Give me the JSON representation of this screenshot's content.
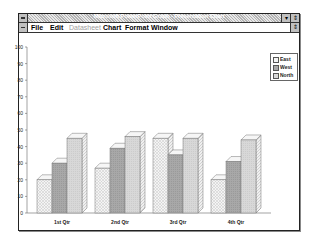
{
  "window": {
    "title": "Microsoft PowerPoint Graph - Presentation Chart",
    "controls": {
      "minimize": "▾",
      "restore": "⇕"
    }
  },
  "menu": {
    "items": [
      {
        "label": "File",
        "enabled": true
      },
      {
        "label": "Edit",
        "enabled": true
      },
      {
        "label": "Datasheet",
        "enabled": false
      },
      {
        "label": "Chart",
        "enabled": true
      },
      {
        "label": "Format",
        "enabled": true
      },
      {
        "label": "Window",
        "enabled": true
      }
    ],
    "restore_glyph": "⇕"
  },
  "legend": {
    "items": [
      {
        "label": "East",
        "color": "#eeeeee"
      },
      {
        "label": "West",
        "color": "#a8a8a8"
      },
      {
        "label": "North",
        "color": "#d6d6d6"
      }
    ]
  },
  "chart_data": {
    "type": "bar",
    "style": "3d-clustered-column",
    "title": "",
    "xlabel": "",
    "ylabel": "",
    "categories": [
      "1st Qtr",
      "2nd Qtr",
      "3rd Qtr",
      "4th Qtr"
    ],
    "series": [
      {
        "name": "East",
        "values": [
          20,
          27,
          45,
          20
        ]
      },
      {
        "name": "West",
        "values": [
          30,
          39,
          35,
          31
        ]
      },
      {
        "name": "North",
        "values": [
          45,
          46,
          45,
          44
        ]
      }
    ],
    "ylim": [
      0,
      100
    ],
    "yticks": [
      "0",
      "10",
      "20",
      "30",
      "40",
      "50",
      "60",
      "70",
      "80",
      "90",
      "100"
    ],
    "grid": false,
    "legend_position": "top-right"
  }
}
